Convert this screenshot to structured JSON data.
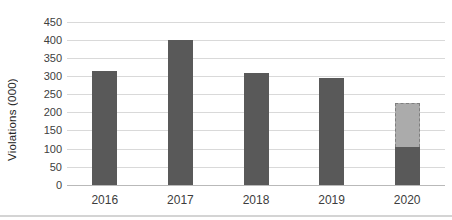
{
  "chart_data": {
    "type": "bar",
    "title": "",
    "xlabel": "",
    "ylabel": "Violations (000)",
    "categories": [
      "2016",
      "2017",
      "2018",
      "2019",
      "2020"
    ],
    "series": [
      {
        "name": "actual",
        "values": [
          315,
          400,
          310,
          297,
          105
        ],
        "color": "#595959",
        "style": "solid"
      },
      {
        "name": "projected-remainder",
        "values": [
          0,
          0,
          0,
          0,
          121
        ],
        "color": "#ababab",
        "style": "dashed-outline"
      }
    ],
    "stacked": true,
    "ylim": [
      0,
      450
    ],
    "ytick_step": 50,
    "yticks": [
      0,
      50,
      100,
      150,
      200,
      250,
      300,
      350,
      400,
      450
    ],
    "grid": "horizontal",
    "legend": "none",
    "colors": {
      "bar_solid": "#595959",
      "bar_projected_fill": "#ababab",
      "bar_projected_border": "#7f7f7f",
      "gridline": "#d9d9d9",
      "baseline": "#b9b9b9",
      "tick_text": "#404040",
      "axis_title_text": "#262626",
      "bottom_rule": "#d4d4d4"
    }
  }
}
